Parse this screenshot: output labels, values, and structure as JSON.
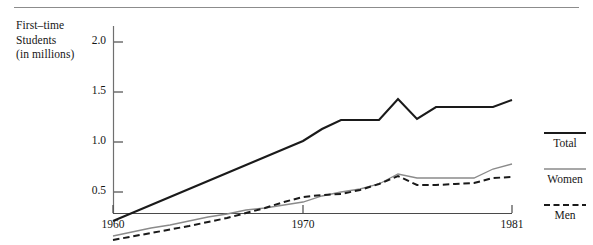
{
  "chart_data": {
    "type": "line",
    "title": "",
    "xlabel": "",
    "ylabel": "First–time\nStudents\n(in millions)",
    "ylabel_lines": [
      "First–time",
      "Students",
      "(in millions)"
    ],
    "x": [
      1960,
      1961,
      1962,
      1963,
      1964,
      1965,
      1966,
      1967,
      1968,
      1969,
      1970,
      1971,
      1972,
      1973,
      1974,
      1975,
      1976,
      1977,
      1978,
      1979,
      1980,
      1981
    ],
    "xlim": [
      1960,
      1981
    ],
    "ylim": [
      0,
      2.15
    ],
    "xticks": [
      1960,
      1970,
      1981
    ],
    "xtick_labels": [
      "1960",
      "1970",
      "1981"
    ],
    "yticks": [
      0.5,
      1.0,
      1.5,
      2.0
    ],
    "ytick_labels": [
      "0.5",
      "1.0",
      "1.5",
      "2.0"
    ],
    "grid": false,
    "legend_position": "right",
    "series": [
      {
        "name": "Total",
        "style": "solid-thick",
        "color": "#1a1a1a",
        "values": [
          0.21,
          0.29,
          0.37,
          0.45,
          0.53,
          0.61,
          0.69,
          0.77,
          0.85,
          0.93,
          1.01,
          1.13,
          1.22,
          1.22,
          1.22,
          1.43,
          1.23,
          1.35,
          1.35,
          1.35,
          1.35,
          1.42
        ]
      },
      {
        "name": "Women",
        "style": "solid-thin",
        "color": "#8a8a8a",
        "values": [
          0.06,
          0.1,
          0.14,
          0.17,
          0.21,
          0.25,
          0.28,
          0.32,
          0.34,
          0.37,
          0.4,
          0.46,
          0.5,
          0.53,
          0.58,
          0.68,
          0.64,
          0.64,
          0.64,
          0.64,
          0.73,
          0.78
        ]
      },
      {
        "name": "Men",
        "style": "dashed",
        "color": "#1a1a1a",
        "values": [
          0.02,
          0.055,
          0.09,
          0.125,
          0.16,
          0.2,
          0.24,
          0.29,
          0.34,
          0.4,
          0.45,
          0.47,
          0.48,
          0.52,
          0.58,
          0.66,
          0.57,
          0.57,
          0.58,
          0.59,
          0.64,
          0.65
        ]
      }
    ],
    "legend": [
      {
        "label": "Total",
        "style": "solid-thick",
        "color": "#1a1a1a"
      },
      {
        "label": "Women",
        "style": "solid-thin",
        "color": "#8a8a8a"
      },
      {
        "label": "Men",
        "style": "dashed",
        "color": "#1a1a1a"
      }
    ]
  }
}
